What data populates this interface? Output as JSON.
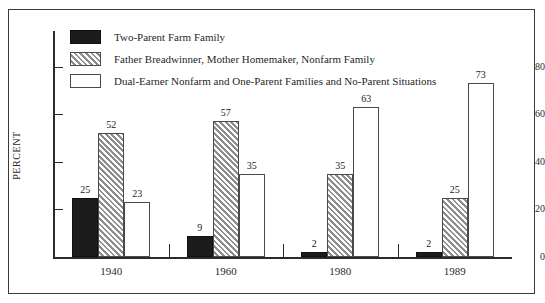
{
  "chart_data": {
    "type": "bar",
    "title": "",
    "subtitle": "",
    "xlabel": "",
    "ylabel": "PERCENT",
    "categories": [
      "1940",
      "1960",
      "1980",
      "1989"
    ],
    "series": [
      {
        "name": "Two-Parent Farm Family",
        "swatch": "solid-black",
        "values": [
          25,
          9,
          2,
          2
        ]
      },
      {
        "name": "Father Breadwinner, Mother Homemaker, Nonfarm Family",
        "swatch": "diagonal-hatch-gray",
        "values": [
          52,
          57,
          35,
          25
        ]
      },
      {
        "name": "Dual-Earner Nonfarm and One-Parent Families and No-Parent Situations",
        "swatch": "white-outline",
        "values": [
          23,
          35,
          63,
          73
        ]
      }
    ],
    "ylim": [
      0,
      95
    ],
    "yticks": [
      0,
      20,
      40,
      60,
      80
    ],
    "ytick_labels": [
      "0",
      "20",
      "40",
      "60",
      "80"
    ],
    "grid": false,
    "legend_position": "top-left-inside",
    "data_labels": true,
    "colors": {
      "series_0": "#1c1c1c",
      "series_1": "#b9b9b9",
      "series_2": "#ffffff",
      "axis": "#2b2b2b",
      "frame": "#3a3a3a",
      "text": "#1a1a1a",
      "background": "#ffffff"
    }
  }
}
